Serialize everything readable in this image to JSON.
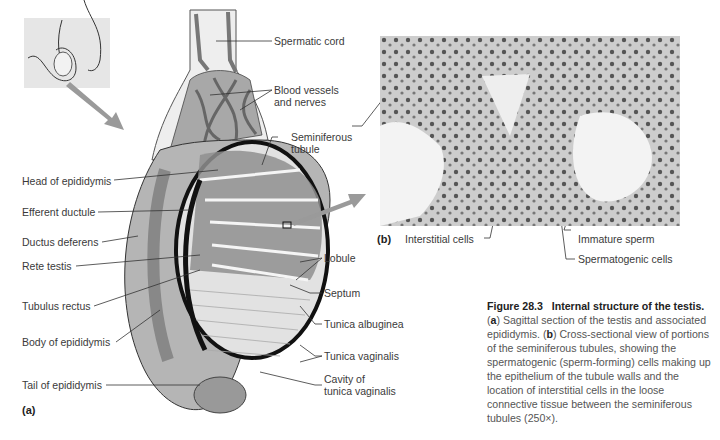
{
  "figure": {
    "number": "Figure 28.3",
    "title": "Internal structure of the testis.",
    "caption_parts": [
      {
        "bold": "a",
        "text": " Sagittal section of the testis and associated epididymis. "
      },
      {
        "bold": "b",
        "text": " Cross-sectional view of portions of the seminiferous tubules, showing the spermatogenic (sperm-forming) cells making up the epithelium of the tubule walls and the location of interstitial cells in the loose connective tissue between the seminiferous tubules (250×)."
      }
    ]
  },
  "panel_a": {
    "tag": "(a)",
    "labels_left": [
      "Head of epididymis",
      "Efferent ductule",
      "Ductus deferens",
      "Rete testis",
      "Tubulus rectus",
      "Body of epididymis",
      "Tail of epididymis"
    ],
    "labels_right": [
      "Spermatic cord",
      "Blood vessels",
      "and nerves",
      "Seminiferous",
      "tubule",
      "Lobule",
      "Septum",
      "Tunica albuginea",
      "Tunica vaginalis",
      "Cavity of",
      "tunica vaginalis"
    ]
  },
  "panel_b": {
    "tag": "(b)",
    "labels": [
      "Interstitial cells",
      "Immature sperm",
      "Spermatogenic cells"
    ]
  },
  "colors": {
    "text": "#3a3a3a",
    "tissue_gray": "#8f8f8f",
    "light_gray": "#dcdcdc",
    "arrow_gray": "#9a9a9a",
    "outline": "#111111"
  }
}
